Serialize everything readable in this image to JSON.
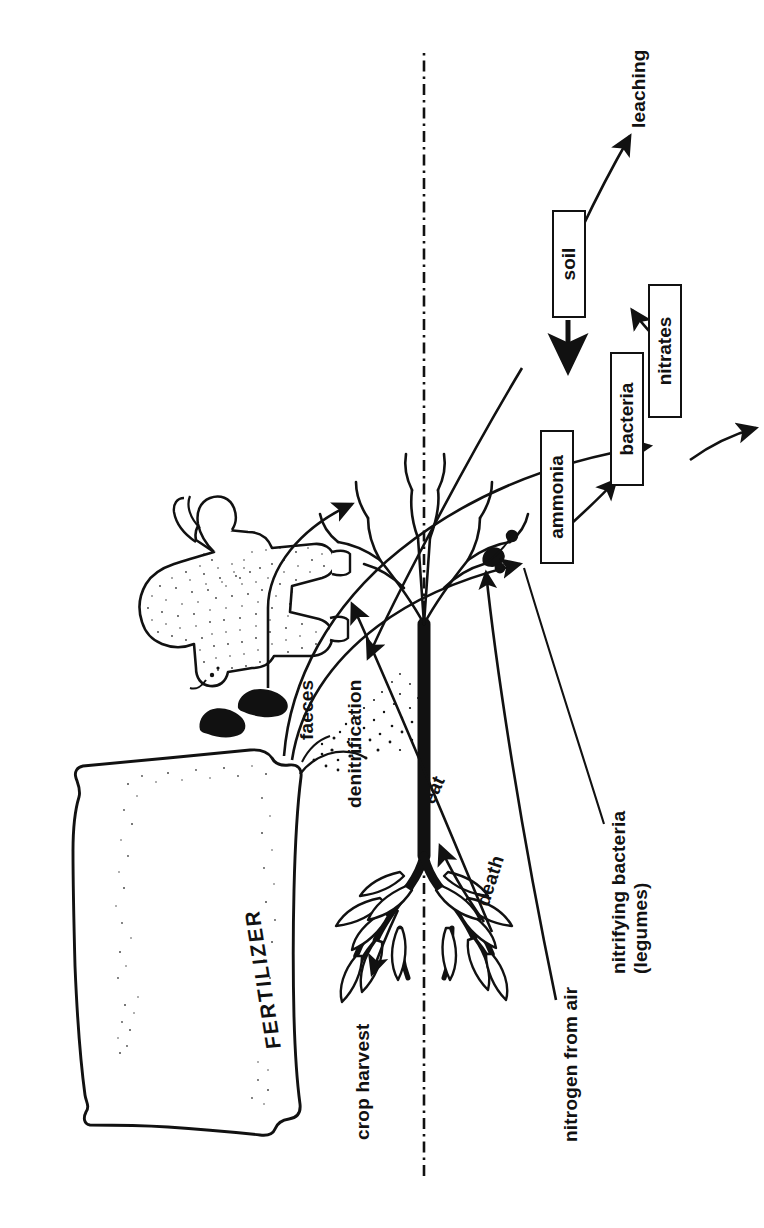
{
  "figure": {
    "orientation": "rotated-90-ccw",
    "background_color": "#ffffff",
    "ink_color": "#111111"
  },
  "ground_line": {
    "name": "ground-level",
    "style": "dash-dot"
  },
  "illustrations": [
    {
      "id": "fertilizer-bag",
      "label": "FERTILIZER",
      "description": "hand-drawn sack of fertilizer with granules spilling out"
    },
    {
      "id": "cow",
      "label": "",
      "description": "stippled side view of a cow"
    },
    {
      "id": "faeces",
      "label": "faeces",
      "description": "two dropping marks behind the cow"
    },
    {
      "id": "plant",
      "label": "",
      "description": "plant with leafy shoots above ground and branching roots with nodules below"
    }
  ],
  "boxes": [
    {
      "id": "ammonia",
      "label": "ammonia"
    },
    {
      "id": "bacteria",
      "label": "bacteria"
    },
    {
      "id": "nitrates",
      "label": "nitrates"
    },
    {
      "id": "soil",
      "label": "soil"
    }
  ],
  "labels": {
    "fertilizer": "FERTILIZER",
    "faeces": "faeces",
    "eat": "eat",
    "death": "death",
    "crop_harvest": "crop harvest",
    "denitrification": "denitrification",
    "nitrogen_from_air": "nitrogen from air",
    "nitrifying_bacteria_line1": "nitrifying bacteria",
    "nitrifying_bacteria_line2": "(legumes)",
    "leaching": "leaching"
  },
  "flows": [
    {
      "from": "fertilizer-bag",
      "to": "ammonia",
      "label": ""
    },
    {
      "from": "fertilizer-bag",
      "to": "nitrates",
      "label": ""
    },
    {
      "from": "faeces",
      "to": "ammonia",
      "label": ""
    },
    {
      "from": "ammonia",
      "to": "bacteria",
      "label": ""
    },
    {
      "from": "bacteria",
      "to": "nitrates",
      "label": ""
    },
    {
      "from": "nitrates",
      "to": "soil",
      "label": ""
    },
    {
      "from": "soil",
      "to": "plant-roots",
      "label": ""
    },
    {
      "from": "soil",
      "to": "leaching",
      "label": "leaching"
    },
    {
      "from": "plant-roots",
      "to": "denitrification",
      "label": "denitrification"
    },
    {
      "from": "plant",
      "to": "crop-harvest",
      "label": "crop harvest"
    },
    {
      "from": "plant",
      "to": "cow",
      "label": "eat"
    },
    {
      "from": "plant",
      "to": "soil-surface",
      "label": "death"
    },
    {
      "from": "nitrogen-from-air",
      "to": "root-nodules",
      "label": "nitrogen from air"
    }
  ]
}
